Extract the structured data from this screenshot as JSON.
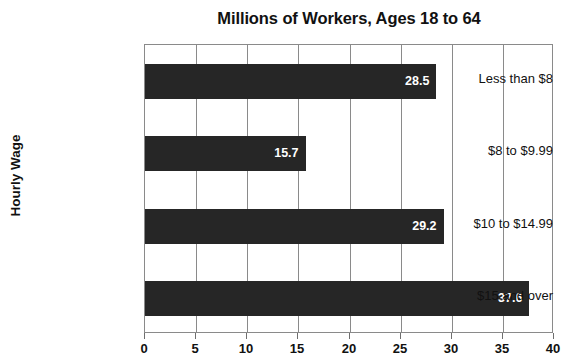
{
  "chart_data": {
    "type": "bar",
    "orientation": "horizontal",
    "title": "Millions of Workers, Ages 18 to 64",
    "xlabel": "",
    "ylabel": "Hourly Wage",
    "categories": [
      "Less than $8",
      "$8 to $9.99",
      "$10 to $14.99",
      "$15 and over"
    ],
    "values": [
      28.5,
      15.7,
      29.2,
      37.6
    ],
    "value_labels": [
      "28.5",
      "15.7",
      "29.2",
      "37.6"
    ],
    "xlim": [
      0,
      40
    ],
    "xticks": [
      0,
      5,
      10,
      15,
      20,
      25,
      30,
      35,
      40
    ],
    "xtick_labels": [
      "0",
      "5",
      "10",
      "15",
      "20",
      "25",
      "30",
      "35",
      "40"
    ],
    "grid": "vertical",
    "legend": "none",
    "bar_color": "#262626",
    "value_label_color": "#ffffff",
    "axis_color": "#8a8a8a",
    "background": "#ffffff"
  }
}
